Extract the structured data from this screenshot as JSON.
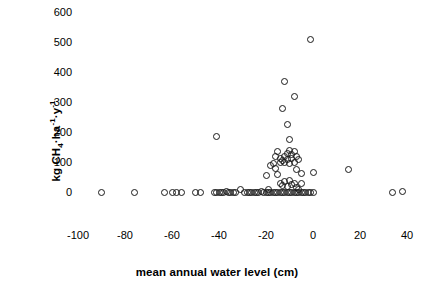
{
  "chart_data": {
    "type": "scatter",
    "title": "",
    "xlabel": "mean annual water level (cm)",
    "ylabel": "kg CH4·ha-1·y-1",
    "ylabel_parts": {
      "prefix": "kg CH",
      "sub1": "4",
      "mid": "·ha",
      "sup1": "-1",
      "mid2": "·y",
      "sup2": "-1"
    },
    "xlim": [
      -110,
      50
    ],
    "ylim": [
      0,
      600
    ],
    "xticks": [
      -100,
      -80,
      -60,
      -40,
      -20,
      0,
      20,
      40
    ],
    "yticks": [
      0,
      100,
      200,
      300,
      400,
      500,
      600
    ],
    "xtick_labels": [
      "-100",
      "-80",
      "-60",
      "-40",
      "-20",
      "0",
      "20",
      "40"
    ],
    "ytick_labels": [
      "0",
      "100",
      "200",
      "300",
      "400",
      "500",
      "600"
    ],
    "grid": false,
    "legend": false,
    "marker": "open-circle",
    "marker_color": "#1a1a1a",
    "points": [
      [
        -90,
        0
      ],
      [
        -76,
        0
      ],
      [
        -63,
        0
      ],
      [
        -60,
        0
      ],
      [
        -58,
        0
      ],
      [
        -56,
        0
      ],
      [
        -50,
        0
      ],
      [
        -48,
        0
      ],
      [
        -41,
        185
      ],
      [
        -42,
        0
      ],
      [
        -41,
        0
      ],
      [
        -40,
        0
      ],
      [
        -39,
        0
      ],
      [
        -38,
        0
      ],
      [
        -37,
        2
      ],
      [
        -36,
        0
      ],
      [
        -35,
        0
      ],
      [
        -34,
        0
      ],
      [
        -33,
        0
      ],
      [
        -31,
        8
      ],
      [
        -29,
        0
      ],
      [
        -28,
        0
      ],
      [
        -27,
        0
      ],
      [
        -26,
        0
      ],
      [
        -25,
        0
      ],
      [
        -24,
        0
      ],
      [
        -23,
        0
      ],
      [
        -22,
        2
      ],
      [
        -21,
        0
      ],
      [
        -20,
        0
      ],
      [
        -20,
        55
      ],
      [
        -19,
        0
      ],
      [
        -19,
        8
      ],
      [
        -18,
        0
      ],
      [
        -18,
        90
      ],
      [
        -17,
        0
      ],
      [
        -17,
        95
      ],
      [
        -16,
        0
      ],
      [
        -16,
        80
      ],
      [
        -16,
        118
      ],
      [
        -15,
        0
      ],
      [
        -15,
        60
      ],
      [
        -15,
        135
      ],
      [
        -14,
        0
      ],
      [
        -14,
        30
      ],
      [
        -14,
        100
      ],
      [
        -14,
        112
      ],
      [
        -13,
        0
      ],
      [
        -13,
        22
      ],
      [
        -13,
        105
      ],
      [
        -13,
        280
      ],
      [
        -12,
        0
      ],
      [
        -12,
        35
      ],
      [
        -12,
        98
      ],
      [
        -12,
        120
      ],
      [
        -12,
        370
      ],
      [
        -11,
        0
      ],
      [
        -11,
        18
      ],
      [
        -11,
        108
      ],
      [
        -11,
        130
      ],
      [
        -11,
        225
      ],
      [
        -10,
        0
      ],
      [
        -10,
        40
      ],
      [
        -10,
        95
      ],
      [
        -10,
        138
      ],
      [
        -10,
        175
      ],
      [
        -9,
        0
      ],
      [
        -9,
        25
      ],
      [
        -9,
        112
      ],
      [
        -9,
        125
      ],
      [
        -8,
        0
      ],
      [
        -8,
        30
      ],
      [
        -8,
        100
      ],
      [
        -8,
        135
      ],
      [
        -8,
        320
      ],
      [
        -7,
        0
      ],
      [
        -7,
        15
      ],
      [
        -7,
        75
      ],
      [
        -7,
        118
      ],
      [
        -6,
        0
      ],
      [
        -6,
        8
      ],
      [
        -6,
        110
      ],
      [
        -5,
        0
      ],
      [
        -5,
        28
      ],
      [
        -5,
        62
      ],
      [
        -4,
        0
      ],
      [
        -3,
        0
      ],
      [
        -2,
        0
      ],
      [
        -1,
        0
      ],
      [
        -1,
        510
      ],
      [
        0,
        0
      ],
      [
        0,
        65
      ],
      [
        15,
        75
      ],
      [
        34,
        0
      ],
      [
        38,
        3
      ]
    ]
  }
}
